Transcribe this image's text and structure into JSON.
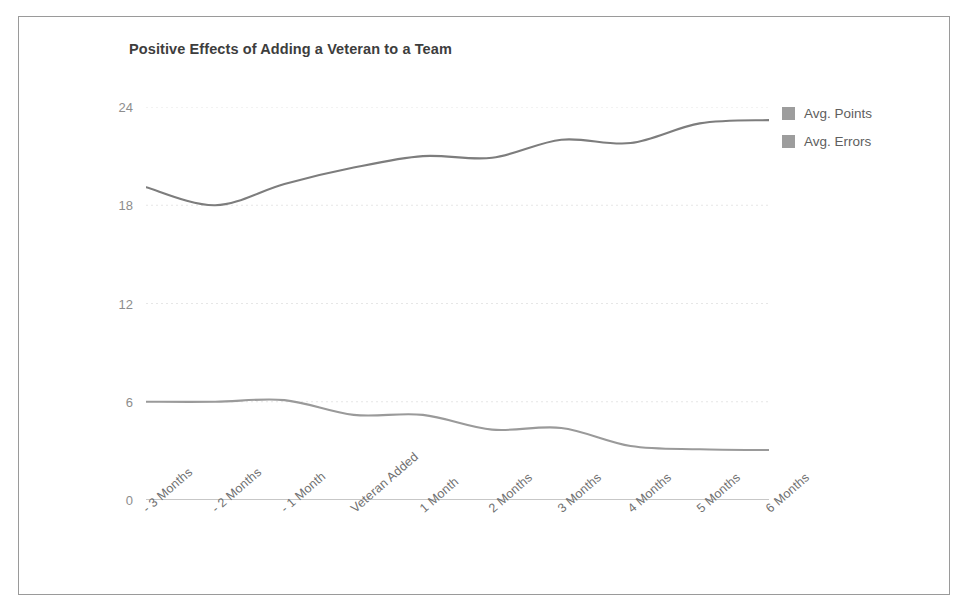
{
  "figure": {
    "frame_border_color": "#9a9a9a",
    "background": "#ffffff"
  },
  "legend": {
    "position": "right",
    "items": [
      {
        "label": "Avg. Points",
        "swatch_color": "#9d9d9d",
        "icon": "square-swatch-icon"
      },
      {
        "label": "Avg. Errors",
        "swatch_color": "#9d9d9d",
        "icon": "square-swatch-icon"
      }
    ]
  },
  "chart_data": {
    "type": "line",
    "title": "Positive Effects of Adding a Veteran to a Team",
    "xlabel": "",
    "ylabel": "",
    "ylim": [
      0,
      24
    ],
    "yticks": [
      0,
      6,
      12,
      18,
      24
    ],
    "ytick_labels": [
      "0",
      "6",
      "12",
      "18",
      "24"
    ],
    "grid": true,
    "grid_axis": "y",
    "legend_position": "right",
    "smooth": true,
    "categories": [
      "- 3 Months",
      "- 2 Months",
      "- 1 Month",
      "Veteran Added",
      "1 Month",
      "2 Months",
      "3 Months",
      "4 Months",
      "5 Months",
      "6 Months"
    ],
    "series": [
      {
        "name": "Avg. Points",
        "color": "#7d7d7d",
        "values": [
          19.1,
          18.0,
          19.3,
          20.3,
          21.0,
          20.9,
          22.0,
          21.8,
          23.0,
          23.2
        ]
      },
      {
        "name": "Avg. Errors",
        "color": "#9a9a9a",
        "values": [
          6.0,
          6.0,
          6.1,
          5.2,
          5.2,
          4.3,
          4.4,
          3.3,
          3.1,
          3.05
        ]
      }
    ]
  }
}
